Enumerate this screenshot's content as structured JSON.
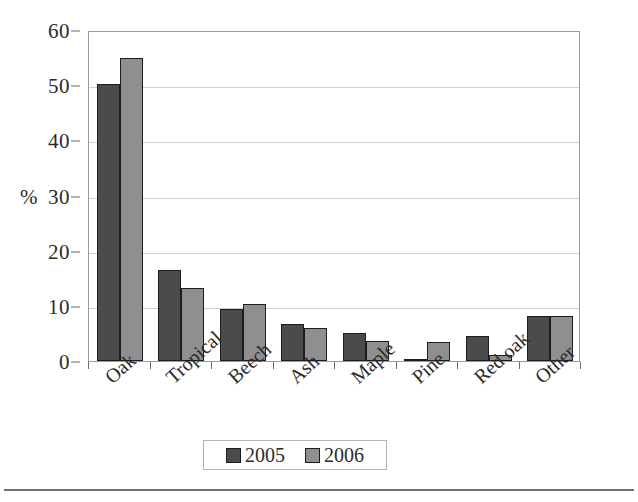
{
  "chart_data": {
    "type": "bar",
    "title": "",
    "xlabel": "",
    "ylabel": "%",
    "ylim": [
      0,
      60
    ],
    "yticks": [
      0,
      10,
      20,
      30,
      40,
      50,
      60
    ],
    "grid": true,
    "legend_position": "bottom",
    "categories": [
      "Oak",
      "Tropical",
      "Beech",
      "Ash",
      "Maple",
      "Pine",
      "Red oak",
      "Other"
    ],
    "series": [
      {
        "name": "2005",
        "color": "#4b4b4b",
        "values": [
          50.2,
          16.5,
          9.5,
          6.7,
          5.0,
          0.2,
          4.5,
          8.2
        ]
      },
      {
        "name": "2006",
        "color": "#8f8f8f",
        "values": [
          55.0,
          13.2,
          10.3,
          6.0,
          3.7,
          3.5,
          1.0,
          8.1
        ]
      }
    ]
  },
  "axis": {
    "y_title": "%",
    "y_tick_labels": [
      "0",
      "10",
      "20",
      "30",
      "40",
      "50",
      "60"
    ]
  },
  "legend": {
    "entries": [
      {
        "label": "2005",
        "swatch": "dark-gray-swatch"
      },
      {
        "label": "2006",
        "swatch": "light-gray-swatch"
      }
    ]
  },
  "colors": {
    "series_2005": "#4b4b4b",
    "series_2006": "#8f8f8f",
    "gridline": "#cfcfcf",
    "frame": "#9a9a9a",
    "text": "#2b2b2b"
  }
}
